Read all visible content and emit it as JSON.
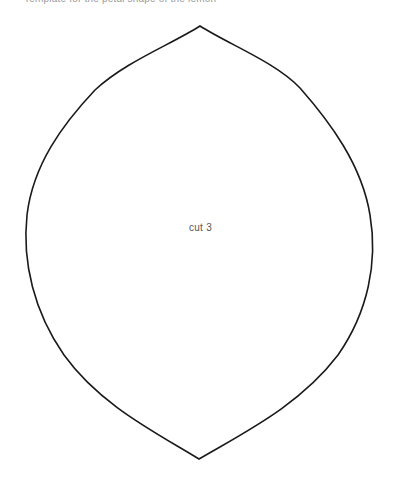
{
  "document": {
    "header_text_cropped": "Template for the petal shape of the lemon",
    "shape": {
      "name": "petal-template",
      "stroke_color": "#1a1a1a",
      "fill_color": "#ffffff",
      "label": "cut 3"
    }
  }
}
